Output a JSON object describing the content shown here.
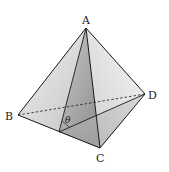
{
  "figure": {
    "type": "tetrahedron",
    "vertices": {
      "A": {
        "label": "A",
        "x": 86,
        "y": 28
      },
      "B": {
        "label": "B",
        "x": 18,
        "y": 115
      },
      "C": {
        "label": "C",
        "x": 100,
        "y": 148
      },
      "D": {
        "label": "D",
        "x": 145,
        "y": 94
      }
    },
    "midpoint_BC": {
      "x": 59,
      "y": 132
    },
    "angle_label": "θ",
    "hidden_edges": [
      "BD"
    ],
    "colors": {
      "edge": "#1a1a1a",
      "face_front_left": "#d6d6d6",
      "face_front_right": "#e6e6e6",
      "section_dark": "#9a9a9a",
      "section_light": "#c4c4c4"
    }
  }
}
